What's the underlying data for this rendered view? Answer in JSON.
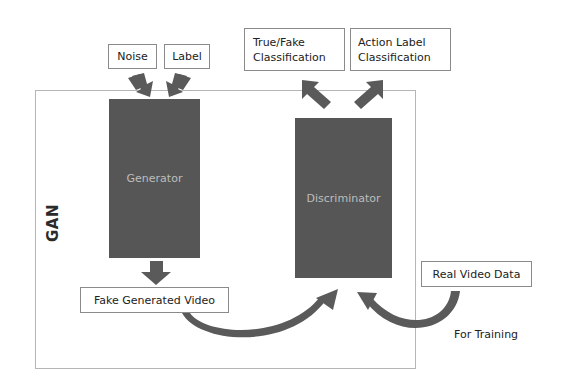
{
  "diagram": {
    "frame_label": "GAN",
    "inputs": {
      "noise": "Noise",
      "label": "Label"
    },
    "blocks": {
      "generator": "Generator",
      "discriminator": "Discriminator"
    },
    "outputs": {
      "true_fake": [
        "True/Fake",
        "Classification"
      ],
      "action_label": [
        "Action Label",
        "Classification"
      ]
    },
    "fake_video": "Fake Generated Video",
    "real_video": "Real Video Data",
    "training_caption": "For Training"
  },
  "colors": {
    "block_fill": "#565656",
    "block_text": "#bdbdbd",
    "arrow_fill": "#5a5a5a",
    "frame_border": "#b5b5b5",
    "box_border": "#8a8a8a"
  }
}
